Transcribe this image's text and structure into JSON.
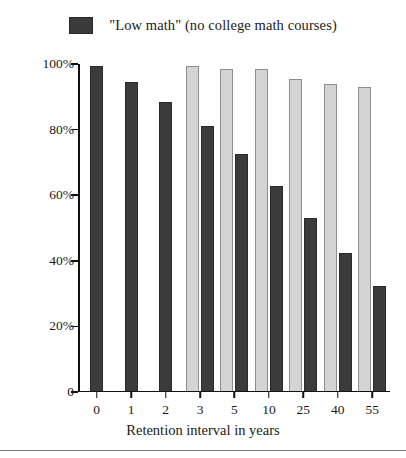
{
  "legend": {
    "swatch_color": "#3b3b3b",
    "label": "\"Low math\" (no college math courses)"
  },
  "chart_data": {
    "type": "bar",
    "title": "",
    "xlabel": "Retention interval in years",
    "ylabel": "Percentage remembered",
    "categories": [
      "0",
      "1",
      "2",
      "3",
      "5",
      "10",
      "25",
      "40",
      "55"
    ],
    "ylim": [
      0,
      100
    ],
    "yticks": [
      0,
      20,
      40,
      60,
      80,
      100
    ],
    "ytick_labels": [
      "0",
      "20%",
      "40%",
      "60%",
      "80%",
      "100%"
    ],
    "grid": false,
    "legend_position": "top-center",
    "series": [
      {
        "name": "High math (college math courses)",
        "color": "#d4d4d4",
        "in_legend": false,
        "values": [
          null,
          null,
          null,
          99,
          98,
          98,
          95,
          93.5,
          92.5
        ]
      },
      {
        "name": "\"Low math\" (no college math courses)",
        "color": "#3b3b3b",
        "in_legend": true,
        "values": [
          99,
          94,
          88,
          80.5,
          72,
          62.5,
          52.5,
          42,
          32
        ]
      }
    ]
  }
}
